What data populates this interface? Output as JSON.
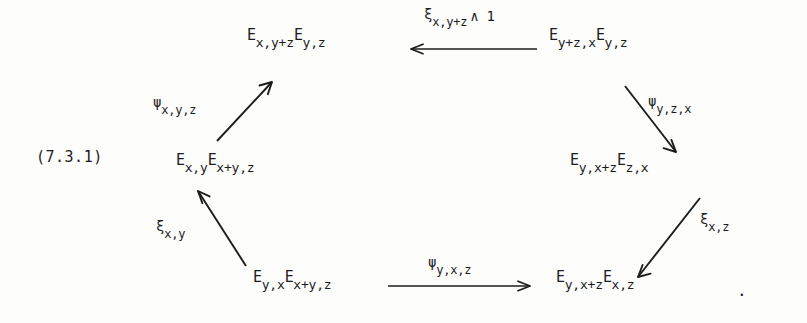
{
  "figure": {
    "equation_number": "(7.3.1)",
    "trailing_punctuation": ".",
    "shape": "hexagonal commutative diagram",
    "ink_color": "#1c1c1c",
    "background_color": "#fdfdfc"
  },
  "nodes": {
    "top_left": {
      "plain": "E_{x,y+z} E_{y,z}",
      "first_base": "E",
      "first_sub": "x,y+z",
      "second_base": "E",
      "second_sub": "y,z"
    },
    "top_right": {
      "plain": "E_{y+z,x} E_{y,z}",
      "first_base": "E",
      "first_sub": "y+z,x",
      "second_base": "E",
      "second_sub": "y,z"
    },
    "middle_left": {
      "plain": "E_{x,y} E_{x+y,z}",
      "first_base": "E",
      "first_sub": "x,y",
      "second_base": "E",
      "second_sub": "x+y,z"
    },
    "middle_right": {
      "plain": "E_{y,x+z} E_{z,x}",
      "first_base": "E",
      "first_sub": "y,x+z",
      "second_base": "E",
      "second_sub": "z,x"
    },
    "bottom_left": {
      "plain": "E_{y,x} E_{x+y,z}",
      "first_base": "E",
      "first_sub": "y,x",
      "second_base": "E",
      "second_sub": "x+y,z"
    },
    "bottom_right": {
      "plain": "E_{y,x+z} E_{x,z}",
      "first_base": "E",
      "first_sub": "y,x+z",
      "second_base": "E",
      "second_sub": "x,z"
    }
  },
  "arrows": {
    "top": {
      "plain": "xi_{x,y+z} ^ 1",
      "glyph": "ξ",
      "sub": "x,y+z",
      "extra": "∧ 1",
      "direction": "leftwards",
      "from": "top_right",
      "to": "top_left"
    },
    "upper_left_diagonal": {
      "plain": "psi_{x,y,z}",
      "glyph": "ψ",
      "sub": "x,y,z",
      "extra": "",
      "direction": "up-right",
      "from": "middle_left",
      "to": "top_left"
    },
    "lower_left_diagonal": {
      "plain": "xi_{x,y}",
      "glyph": "ξ",
      "sub": "x,y",
      "extra": "",
      "direction": "up-left",
      "from": "bottom_left",
      "to": "middle_left"
    },
    "bottom": {
      "plain": "psi_{y,x,z}",
      "glyph": "ψ",
      "sub": "y,x,z",
      "extra": "",
      "direction": "rightwards",
      "from": "bottom_left",
      "to": "bottom_right"
    },
    "upper_right_diagonal": {
      "plain": "psi_{y,z,x}",
      "glyph": "ψ",
      "sub": "y,z,x",
      "extra": "",
      "direction": "down-right",
      "from": "top_right",
      "to": "middle_right"
    },
    "lower_right_diagonal": {
      "plain": "xi_{x,z}",
      "glyph": "ξ",
      "sub": "x,z",
      "extra": "",
      "direction": "down-left",
      "from": "middle_right",
      "to": "bottom_right"
    }
  }
}
